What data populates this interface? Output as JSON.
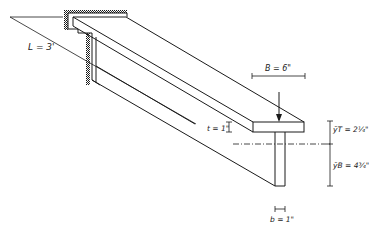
{
  "diagram": {
    "labels": {
      "length": "L = 3'",
      "flange_width": "B = 6\"",
      "flange_thickness": "t = 1\"",
      "y_top": "ȳT = 2¼\"",
      "y_bottom": "ȳB = 4¾\"",
      "web_width": "b = 1\""
    },
    "elements": {
      "support": "fixed wall (hatched)",
      "beam": "T-section cantilever",
      "load": "downward point load at free end",
      "neutral_axis": "dash-dot centroidal line"
    },
    "colors": {
      "line": "#1a1a1a",
      "background": "#ffffff"
    }
  }
}
